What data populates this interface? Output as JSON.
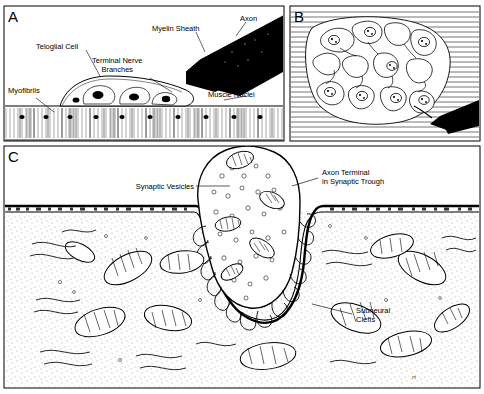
{
  "figure": {
    "background_color": "#ffffff",
    "ink_color": "#000000",
    "width": 484,
    "height": 394
  },
  "panels": [
    {
      "id": "A",
      "label": "A",
      "caption": "Longitudinal view of motor nerve ending on a skeletal muscle fiber",
      "annotations": [
        {
          "name": "teloglial-cell",
          "text": "Teloglial Cell"
        },
        {
          "name": "myelin-sheath",
          "text": "Myelin Sheath"
        },
        {
          "name": "axon",
          "text": "Axon"
        },
        {
          "name": "terminal-nerve-branches",
          "text": "Terminal Nerve\nBranches",
          "line1": "Terminal Nerve",
          "line2": "Branches"
        },
        {
          "name": "muscle-nuclei",
          "text": "Muscle Nuclei"
        },
        {
          "name": "myofibrils",
          "text": "Myofibrils"
        }
      ]
    },
    {
      "id": "B",
      "label": "B",
      "caption": "Surface view of the end plate showing branching nerve terminal and sole-plate nuclei",
      "annotations": []
    },
    {
      "id": "C",
      "label": "C",
      "caption": "Electron-microscopic detail of the axon terminal in the synaptic trough",
      "annotations": [
        {
          "name": "synaptic-vesicles",
          "text": "Synaptic Vesicles"
        },
        {
          "name": "axon-terminal-in-synaptic-trough",
          "line1": "Axon Terminal",
          "line2": "in Synaptic Trough"
        },
        {
          "name": "subneural-clefts",
          "line1": "Subneural",
          "line2": "Clefts"
        }
      ]
    }
  ],
  "signature": "rt"
}
